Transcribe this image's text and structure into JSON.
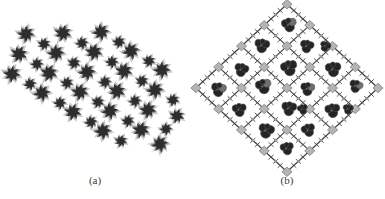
{
  "figure": {
    "background": "#ffffff",
    "type": "crystal-structure-figure"
  },
  "panel_a": {
    "label": "(a)",
    "content": "packing-diagram-of-star-shaped-molecular-clusters",
    "colors": {
      "core": "#2d2d2d",
      "mid": "#575757",
      "fringe": "#9e9e9e",
      "label": "#3b3b3b"
    },
    "stars": [
      [
        26,
        34,
        8,
        0
      ],
      [
        63,
        33,
        8,
        14
      ],
      [
        101,
        32,
        8,
        -12
      ],
      [
        19,
        54,
        8,
        22
      ],
      [
        56,
        53,
        8,
        -7
      ],
      [
        94,
        52,
        8,
        9
      ],
      [
        131,
        51,
        8,
        -18
      ],
      [
        12,
        74,
        8,
        5
      ],
      [
        49,
        73,
        8,
        17
      ],
      [
        87,
        72,
        8,
        -10
      ],
      [
        124,
        71,
        8,
        12
      ],
      [
        162,
        70,
        8,
        -5
      ],
      [
        42,
        93,
        8,
        -15
      ],
      [
        80,
        92,
        8,
        8
      ],
      [
        117,
        91,
        8,
        20
      ],
      [
        155,
        90,
        8,
        -9
      ],
      [
        73,
        112,
        8,
        11
      ],
      [
        110,
        111,
        8,
        -13
      ],
      [
        148,
        110,
        8,
        6
      ],
      [
        177,
        116,
        7,
        15
      ],
      [
        103,
        131,
        8,
        -8
      ],
      [
        141,
        130,
        8,
        13
      ],
      [
        160,
        144,
        8,
        -16
      ],
      [
        44,
        44,
        6,
        10
      ],
      [
        82,
        43,
        6,
        -14
      ],
      [
        119,
        42,
        6,
        5
      ],
      [
        37,
        64,
        6,
        -8
      ],
      [
        74,
        63,
        6,
        16
      ],
      [
        112,
        62,
        6,
        -5
      ],
      [
        149,
        61,
        6,
        12
      ],
      [
        30,
        84,
        6,
        -17
      ],
      [
        67,
        83,
        6,
        7
      ],
      [
        105,
        82,
        6,
        -11
      ],
      [
        142,
        81,
        6,
        14
      ],
      [
        60,
        103,
        6,
        -6
      ],
      [
        98,
        102,
        6,
        18
      ],
      [
        135,
        101,
        6,
        -12
      ],
      [
        173,
        100,
        6,
        9
      ],
      [
        91,
        122,
        6,
        -15
      ],
      [
        128,
        121,
        6,
        5
      ],
      [
        166,
        129,
        6,
        -9
      ],
      [
        121,
        141,
        6,
        12
      ]
    ]
  },
  "panel_b": {
    "label": "(b)",
    "content": "framework-lattice-with-guest-molecules-in-pores",
    "colors": {
      "stick": "#3e3e3e",
      "node_fill": "#b4b4b4",
      "node_edge": "#828282",
      "linker_dot": "#9c9c9c",
      "guest_dark": "#242424",
      "guest_mid": "#707070",
      "guest_edge": "#4f4f4f",
      "label": "#3b3b3b"
    },
    "grid": {
      "center_x": 287,
      "center_y": 88,
      "cells": 4,
      "cell": 32.2,
      "rotation_deg": 45,
      "y_squash": 0.92,
      "node_half": 3.6,
      "tick_len": 3.6
    },
    "hearts": [
      [
        0,
        0,
        1,
        -2,
        1.0,
        -10,
        1
      ],
      [
        1,
        0,
        -2,
        2,
        0.92,
        12,
        0
      ],
      [
        2,
        0,
        2,
        1,
        1.05,
        -5,
        0
      ],
      [
        3,
        0,
        -1,
        -2,
        0.9,
        18,
        1
      ],
      [
        0,
        1,
        -2,
        1,
        1.0,
        8,
        0
      ],
      [
        1,
        1,
        2,
        -1,
        1.1,
        -14,
        0
      ],
      [
        2,
        1,
        -1,
        2,
        0.95,
        5,
        1
      ],
      [
        3,
        1,
        1,
        1,
        1.0,
        -8,
        0
      ],
      [
        0,
        2,
        2,
        2,
        0.95,
        15,
        0
      ],
      [
        1,
        2,
        -2,
        -1,
        1.05,
        -12,
        1
      ],
      [
        2,
        2,
        1,
        -2,
        1.0,
        6,
        0
      ],
      [
        3,
        2,
        -1,
        1,
        0.92,
        -18,
        0
      ],
      [
        0,
        3,
        1,
        1,
        1.0,
        10,
        1
      ],
      [
        1,
        3,
        -1,
        2,
        0.95,
        -6,
        0
      ],
      [
        2,
        3,
        2,
        -1,
        1.05,
        14,
        0
      ],
      [
        3,
        3,
        -2,
        -2,
        0.9,
        -10,
        0
      ],
      [
        1,
        0,
        11,
        -11,
        0.72,
        20,
        0
      ],
      [
        2,
        2,
        11,
        -11,
        0.7,
        -15,
        0
      ],
      [
        3,
        1,
        11,
        -11,
        0.7,
        8,
        0
      ]
    ]
  }
}
